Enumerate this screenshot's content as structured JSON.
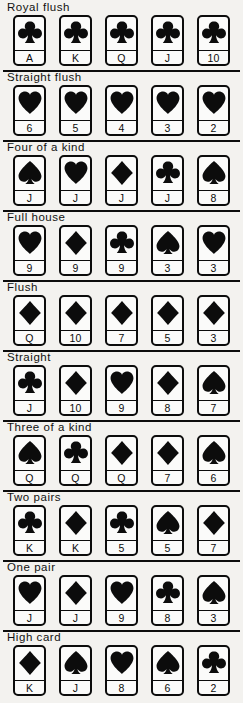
{
  "page": {
    "background_color": "#f3f2ef",
    "ink_color": "#0c0c0c",
    "card_face_color": "#fbfbfa",
    "card_width_px": 33,
    "card_height_px": 51,
    "card_pitch_px": 46,
    "first_card_left_px": 13,
    "section_height_px": 70
  },
  "suit_glyphs": {
    "club": "♣",
    "heart": "♥",
    "diamond": "♦",
    "spade": "♠"
  },
  "sections": [
    {
      "id": "royal-flush",
      "title": "Royal flush",
      "rule_above": false,
      "cards": [
        {
          "rank": "A",
          "suit": "club"
        },
        {
          "rank": "K",
          "suit": "club"
        },
        {
          "rank": "Q",
          "suit": "club"
        },
        {
          "rank": "J",
          "suit": "club"
        },
        {
          "rank": "10",
          "suit": "club"
        }
      ]
    },
    {
      "id": "straight-flush",
      "title": "Straight flush",
      "rule_above": true,
      "cards": [
        {
          "rank": "6",
          "suit": "heart"
        },
        {
          "rank": "5",
          "suit": "heart"
        },
        {
          "rank": "4",
          "suit": "heart"
        },
        {
          "rank": "3",
          "suit": "heart"
        },
        {
          "rank": "2",
          "suit": "heart"
        }
      ]
    },
    {
      "id": "four-of-a-kind",
      "title": "Four of a kind",
      "rule_above": true,
      "cards": [
        {
          "rank": "J",
          "suit": "spade"
        },
        {
          "rank": "J",
          "suit": "heart"
        },
        {
          "rank": "J",
          "suit": "diamond"
        },
        {
          "rank": "J",
          "suit": "club"
        },
        {
          "rank": "8",
          "suit": "spade"
        }
      ]
    },
    {
      "id": "full-house",
      "title": "Full house",
      "rule_above": true,
      "cards": [
        {
          "rank": "9",
          "suit": "heart"
        },
        {
          "rank": "9",
          "suit": "diamond"
        },
        {
          "rank": "9",
          "suit": "club"
        },
        {
          "rank": "3",
          "suit": "spade"
        },
        {
          "rank": "3",
          "suit": "heart"
        }
      ]
    },
    {
      "id": "flush",
      "title": "Flush",
      "rule_above": true,
      "cards": [
        {
          "rank": "Q",
          "suit": "diamond"
        },
        {
          "rank": "10",
          "suit": "diamond"
        },
        {
          "rank": "7",
          "suit": "diamond"
        },
        {
          "rank": "5",
          "suit": "diamond"
        },
        {
          "rank": "3",
          "suit": "diamond"
        }
      ]
    },
    {
      "id": "straight",
      "title": "Straight",
      "rule_above": true,
      "cards": [
        {
          "rank": "J",
          "suit": "club"
        },
        {
          "rank": "10",
          "suit": "diamond"
        },
        {
          "rank": "9",
          "suit": "heart"
        },
        {
          "rank": "8",
          "suit": "diamond"
        },
        {
          "rank": "7",
          "suit": "spade"
        }
      ]
    },
    {
      "id": "three-of-a-kind",
      "title": "Three of a kind",
      "rule_above": true,
      "cards": [
        {
          "rank": "Q",
          "suit": "spade"
        },
        {
          "rank": "Q",
          "suit": "club"
        },
        {
          "rank": "Q",
          "suit": "diamond"
        },
        {
          "rank": "7",
          "suit": "diamond"
        },
        {
          "rank": "6",
          "suit": "spade"
        }
      ]
    },
    {
      "id": "two-pairs",
      "title": "Two pairs",
      "rule_above": true,
      "cards": [
        {
          "rank": "K",
          "suit": "club"
        },
        {
          "rank": "K",
          "suit": "diamond"
        },
        {
          "rank": "5",
          "suit": "club"
        },
        {
          "rank": "5",
          "suit": "spade"
        },
        {
          "rank": "7",
          "suit": "diamond"
        }
      ]
    },
    {
      "id": "one-pair",
      "title": "One pair",
      "rule_above": true,
      "cards": [
        {
          "rank": "J",
          "suit": "heart"
        },
        {
          "rank": "J",
          "suit": "diamond"
        },
        {
          "rank": "9",
          "suit": "heart"
        },
        {
          "rank": "8",
          "suit": "club"
        },
        {
          "rank": "3",
          "suit": "spade"
        }
      ]
    },
    {
      "id": "high-card",
      "title": "High card",
      "rule_above": true,
      "cards": [
        {
          "rank": "K",
          "suit": "diamond"
        },
        {
          "rank": "J",
          "suit": "spade"
        },
        {
          "rank": "8",
          "suit": "heart"
        },
        {
          "rank": "6",
          "suit": "spade"
        },
        {
          "rank": "2",
          "suit": "club"
        }
      ]
    }
  ]
}
